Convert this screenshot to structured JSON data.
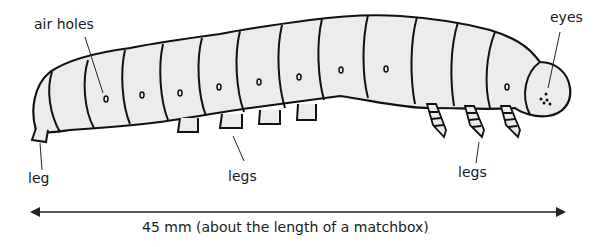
{
  "diagram": {
    "labels": {
      "air_holes": "air holes",
      "eyes": "eyes",
      "leg": "leg",
      "legs_middle": "legs",
      "legs_front": "legs"
    },
    "scale_caption": "45 mm (about the length of a matchbox)",
    "colors": {
      "outline": "#111111",
      "body_fill": "#ececec",
      "text": "#1a1a1a",
      "background": "#ffffff"
    }
  }
}
